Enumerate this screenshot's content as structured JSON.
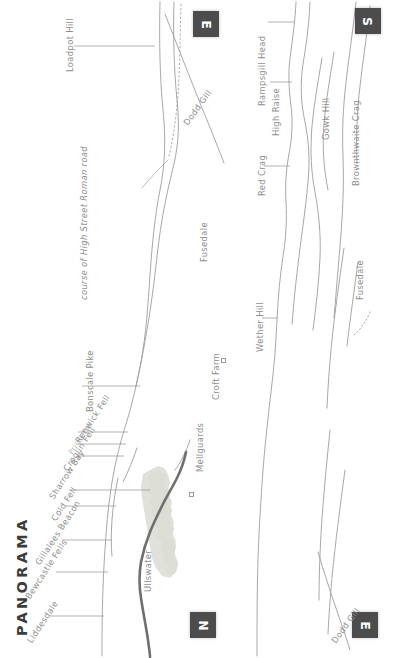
{
  "figure": {
    "title": "PANORAMA",
    "type": "terrain-panorama-map",
    "background_color": "#ffffff",
    "label_color": "#8d8d8d",
    "contour_color": "#9a9a9a",
    "lake_color": "#d9dbd2",
    "road_color": "#6f6f6f",
    "compass_box_color": "#4c4c4c",
    "orientation_note": "map rotated 90 degrees; all labels read vertically"
  },
  "compass_markers": [
    {
      "id": "compass-e-top",
      "label": "E",
      "position": "top-center-left"
    },
    {
      "id": "compass-s-top",
      "label": "S",
      "position": "top-right"
    },
    {
      "id": "compass-n-bottom",
      "label": "N",
      "position": "bottom-center-left"
    },
    {
      "id": "compass-e-bottom",
      "label": "E",
      "position": "bottom-right"
    }
  ],
  "peak_labels": [
    {
      "id": "loadpot-hill",
      "text": "Loadpot Hill",
      "leader": true
    },
    {
      "id": "bonscale-pike",
      "text": "Bonscale Pike",
      "leader": true
    },
    {
      "id": "renwick-fell",
      "text": "Renwick Fell",
      "leader": true
    },
    {
      "id": "priest-fell",
      "text": "Priest Fell",
      "leader": true
    },
    {
      "id": "croglin-fell",
      "text": "Croglin Fell",
      "leader": true
    },
    {
      "id": "sharrow-bay",
      "text": "Sharrow Bay",
      "leader": true
    },
    {
      "id": "cold-fell",
      "text": "Cold Fell",
      "leader": true
    },
    {
      "id": "gillalees-beacon",
      "text": "Gillalees Beacon",
      "leader": true
    },
    {
      "id": "bewcastle-fells",
      "text": "Bewcastle Fells",
      "leader": true
    },
    {
      "id": "liddesdale",
      "text": "Liddesdale",
      "leader": true
    },
    {
      "id": "rampsgill-head",
      "text": "Rampsgill Head",
      "leader": true
    },
    {
      "id": "high-raise",
      "text": "High Raise",
      "leader": true
    },
    {
      "id": "red-crag",
      "text": "Red Crag",
      "leader": true
    },
    {
      "id": "wether-hill",
      "text": "Wether Hill",
      "leader": true
    },
    {
      "id": "gowk-hill",
      "text": "Gowk Hill",
      "leader": false
    },
    {
      "id": "brownthwaite-crag",
      "text": "Brownthwaite Crag",
      "leader": false
    }
  ],
  "feature_labels": [
    {
      "id": "dodd-gill-left",
      "text": "Dodd Gill",
      "style": "diagonal"
    },
    {
      "id": "dodd-gill-right",
      "text": "Dodd Gill",
      "style": "diagonal"
    },
    {
      "id": "fusedale-left",
      "text": "Fusedale",
      "style": "vertical"
    },
    {
      "id": "fusedale-right",
      "text": "Fusedale",
      "style": "vertical"
    },
    {
      "id": "ullswater",
      "text": "Ullswater",
      "style": "vertical"
    },
    {
      "id": "croft-farm",
      "text": "Croft Farm",
      "style": "vertical"
    },
    {
      "id": "mellguards",
      "text": "Mellguards",
      "style": "vertical"
    },
    {
      "id": "roman-road",
      "text": "course of High Street Roman road",
      "style": "italic-vertical"
    }
  ]
}
